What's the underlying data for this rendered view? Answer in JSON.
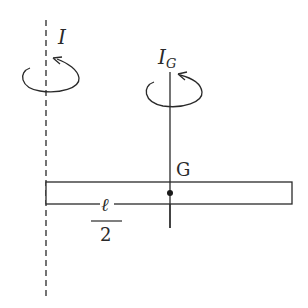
{
  "diagram": {
    "colors": {
      "stroke": "#2a2a2a",
      "background": "#ffffff"
    },
    "axis_end": {
      "label": "I",
      "style": "dashed",
      "rotation_direction": "counterclockwise-arrow"
    },
    "axis_center": {
      "label_main": "I",
      "label_sub": "G",
      "style": "solid",
      "rotation_direction": "counterclockwise-arrow"
    },
    "rod": {
      "center_label": "G",
      "half_length_numerator": "ℓ",
      "half_length_denominator": "2"
    }
  }
}
